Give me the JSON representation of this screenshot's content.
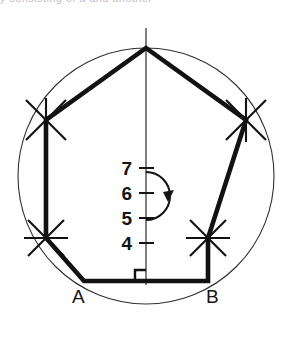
{
  "page": {
    "background_color": "#ffffff",
    "ink_color": "#151515",
    "thin_line_color": "#3a3a3a",
    "partial_top_text": "y consisting of a and another"
  },
  "figure": {
    "type": "geometric-construction",
    "shape": "regular heptagon inscribed in a circle",
    "circle": {
      "cx": 146,
      "cy": 176,
      "r": 128
    },
    "polygon_sides": 7,
    "vertices": [
      {
        "name": "top",
        "x": 146,
        "y": 48
      },
      {
        "name": "upper-right",
        "x": 246,
        "y": 120
      },
      {
        "name": "lower-right",
        "x": 208,
        "y": 238
      },
      {
        "name": "B",
        "x": 208,
        "y": 281
      },
      {
        "name": "A",
        "x": 84,
        "y": 281
      },
      {
        "name": "lower-left",
        "x": 46,
        "y": 238
      },
      {
        "name": "upper-left",
        "x": 46,
        "y": 120
      }
    ],
    "axis": {
      "label": "vertical construction axis",
      "x": 146,
      "y_top": 28,
      "y_bottom": 285
    },
    "right_angle_mark": {
      "x": 136,
      "y": 271,
      "size": 11
    },
    "scale_ticks": [
      {
        "label": "7",
        "y": 168
      },
      {
        "label": "6",
        "y": 193
      },
      {
        "label": "5",
        "y": 218
      },
      {
        "label": "4",
        "y": 243
      }
    ],
    "arrow": {
      "name": "clockwise-rotation-arrow",
      "direction": "clockwise",
      "cx": 150,
      "cy": 196,
      "r": 24
    },
    "construction_arc_marks": 4
  },
  "labels": {
    "vertex_a": "A",
    "vertex_b": "B",
    "division_7": "7",
    "division_6": "6",
    "division_5": "5",
    "division_4": "4"
  }
}
